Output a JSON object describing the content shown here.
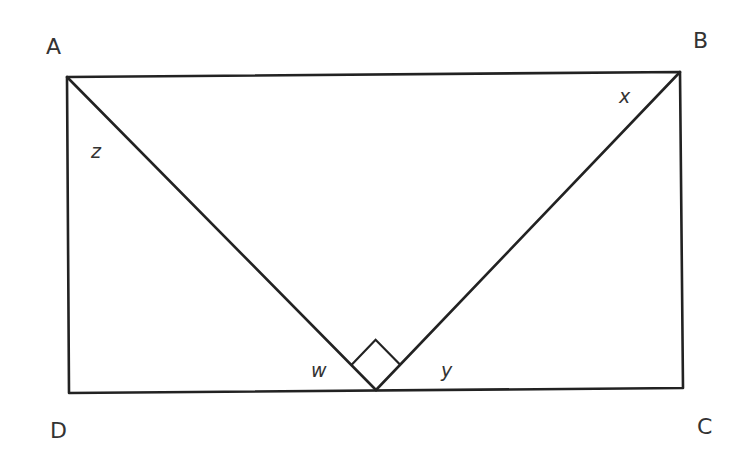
{
  "diagram": {
    "points": {
      "A": {
        "label": "A",
        "x": 67,
        "y": 77,
        "lx": 46,
        "ly": 54
      },
      "B": {
        "label": "B",
        "x": 680,
        "y": 72,
        "lx": 693,
        "ly": 48
      },
      "C": {
        "label": "C",
        "x": 683,
        "y": 388,
        "lx": 697,
        "ly": 434
      },
      "D": {
        "label": "D",
        "x": 69,
        "y": 393,
        "lx": 50,
        "ly": 438
      },
      "E": {
        "label": "",
        "x": 376,
        "y": 390
      }
    },
    "angles": {
      "z": {
        "label": "z",
        "x": 91,
        "y": 158
      },
      "x": {
        "label": "x",
        "x": 619,
        "y": 103
      },
      "w": {
        "label": "w",
        "x": 311,
        "y": 377
      },
      "y": {
        "label": "y",
        "x": 441,
        "y": 377
      }
    },
    "right_angle_marker": {
      "at": "E",
      "size": 35
    },
    "stroke_color": "#222222",
    "text_color": "#333333"
  }
}
